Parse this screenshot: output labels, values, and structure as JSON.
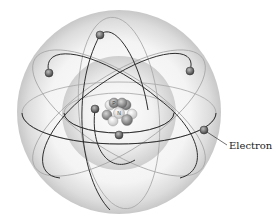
{
  "diagram": {
    "labels": {
      "electron": "Electron"
    },
    "nucleus": {
      "proton_label": "P",
      "neutron_label": "N"
    },
    "colors": {
      "outer_sphere": "#e2e2e2",
      "inner_sphere": "#d9d9d9",
      "orbit_dark": "#333333",
      "orbit_light": "#9a9a9a",
      "electron": "#6e6e6e",
      "proton": "#8a8a8a",
      "neutron": "#f4f4f4"
    },
    "electron_count": 6
  }
}
